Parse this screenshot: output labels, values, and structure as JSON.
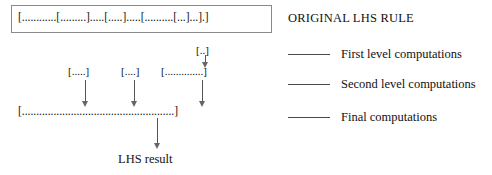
{
  "diagram": {
    "original_rule": {
      "text": "[............[.........].....[.....].....[..........[...]...].]"
    },
    "nodes": [
      {
        "id": "small-bracket",
        "text": "[..]"
      },
      {
        "id": "first-chunk",
        "text": "[.....]"
      },
      {
        "id": "second-chunk",
        "text": "[....]"
      },
      {
        "id": "third-chunk",
        "text": "[..............]"
      },
      {
        "id": "bottom-rule",
        "text": "[.....................................................]"
      }
    ],
    "result_label": "LHS result"
  },
  "legend": {
    "title": "ORIGINAL LHS RULE",
    "items": [
      {
        "label": "First level computations",
        "color": "#4a4a4a"
      },
      {
        "label": "Second level computations",
        "color": "#4a4a4a"
      },
      {
        "label": "Final computations",
        "color": "#4a4a4a"
      }
    ]
  },
  "colors": {
    "stroke": "#555555",
    "arrow_head": "#666666",
    "box_border": "#8a8a8a",
    "text": "#111111",
    "background": "#ffffff"
  }
}
